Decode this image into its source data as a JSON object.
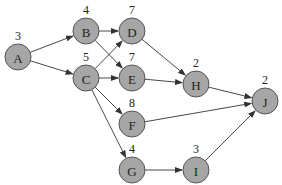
{
  "diagram": {
    "type": "directed-graph",
    "nodes": [
      {
        "id": "A",
        "weight": "3",
        "x": 18,
        "y": 57
      },
      {
        "id": "B",
        "weight": "4",
        "x": 86,
        "y": 31
      },
      {
        "id": "C",
        "weight": "5",
        "x": 86,
        "y": 78
      },
      {
        "id": "D",
        "weight": "7",
        "x": 132,
        "y": 31
      },
      {
        "id": "E",
        "weight": "7",
        "x": 132,
        "y": 78
      },
      {
        "id": "F",
        "weight": "8",
        "x": 132,
        "y": 124
      },
      {
        "id": "G",
        "weight": "4",
        "x": 132,
        "y": 170
      },
      {
        "id": "H",
        "weight": "2",
        "x": 196,
        "y": 84
      },
      {
        "id": "I",
        "weight": "3",
        "x": 196,
        "y": 170
      },
      {
        "id": "J",
        "weight": "2",
        "x": 265,
        "y": 101
      }
    ],
    "edges": [
      [
        "A",
        "B"
      ],
      [
        "A",
        "C"
      ],
      [
        "B",
        "D"
      ],
      [
        "B",
        "E"
      ],
      [
        "C",
        "D"
      ],
      [
        "C",
        "E"
      ],
      [
        "C",
        "F"
      ],
      [
        "C",
        "G"
      ],
      [
        "D",
        "H"
      ],
      [
        "E",
        "H"
      ],
      [
        "H",
        "J"
      ],
      [
        "F",
        "J"
      ],
      [
        "G",
        "I"
      ],
      [
        "I",
        "J"
      ]
    ]
  }
}
